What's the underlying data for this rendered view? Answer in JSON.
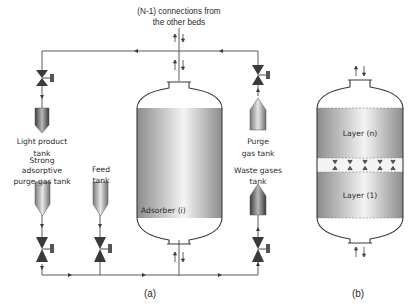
{
  "figure": {
    "header_line1": "(N-1) connections from",
    "header_line2": "the other beds",
    "panel_a": {
      "caption": "(a)",
      "adsorber_label": "Adsorber (i)",
      "tanks": [
        {
          "id": "light-product",
          "line1": "Light product",
          "line2": "tank"
        },
        {
          "id": "strong-purge",
          "line1": "Strong",
          "line2": "adsorptive",
          "line3": "purge gas tank"
        },
        {
          "id": "feed",
          "line1": "Feed",
          "line2": "tank"
        },
        {
          "id": "purge-gas",
          "line1": "Purge",
          "line2": "gas tank"
        },
        {
          "id": "waste-gases",
          "line1": "Waste gases",
          "line2": "tank"
        }
      ]
    },
    "panel_b": {
      "caption": "(b)",
      "layer_top": "Layer (n)",
      "layer_bottom": "Layer (1)"
    }
  },
  "colors": {
    "line": "#4a4a4a",
    "bed_gray": "#8a8a8a",
    "bed_light": "#f2f2f2",
    "valve": "#3a3a3a"
  }
}
